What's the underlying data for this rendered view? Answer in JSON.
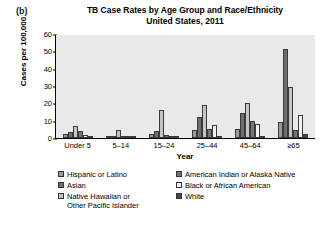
{
  "panel": {
    "label": "(b)"
  },
  "title": {
    "line1": "TB Case Rates by Age Group and Race/Ethnicity",
    "line2": "United States, 2011"
  },
  "axes": {
    "y_title": "Cases per 100,000",
    "x_title": "Year",
    "y_ticks": [
      "0",
      "10",
      "20",
      "30",
      "40",
      "50",
      "60"
    ]
  },
  "legend": {
    "left": [
      {
        "label": "Hispanic or Latino",
        "color": "#9a9a9a"
      },
      {
        "label": "Asian",
        "color": "#6e6e6e"
      },
      {
        "label": "Native Hawaiian or\nOther Pacific Islander",
        "color": "#c4c4c4"
      }
    ],
    "right": [
      {
        "label": "American Indian or Alaska Native",
        "color": "#757575"
      },
      {
        "label": "Black or African American",
        "color": "#f2f2f2"
      },
      {
        "label": "White",
        "color": "#4a4a4a"
      }
    ]
  },
  "chart_data": {
    "type": "bar",
    "title": "TB Case Rates by Age Group and Race/Ethnicity United States, 2011",
    "xlabel": "Year",
    "ylabel": "Cases per 100,000",
    "ylim": [
      0,
      60
    ],
    "ytick_step": 10,
    "grid": false,
    "legend_position": "below",
    "categories": [
      "Under 5",
      "5–14",
      "15–24",
      "25–44",
      "45–64",
      "≥65"
    ],
    "series": [
      {
        "name": "Hispanic or Latino",
        "color": "#9a9a9a",
        "values": [
          2.5,
          0.8,
          2.5,
          4.5,
          5.5,
          9.5
        ]
      },
      {
        "name": "Asian",
        "color": "#6e6e6e",
        "values": [
          3.5,
          1.0,
          4.0,
          12.0,
          14.5,
          52.0
        ]
      },
      {
        "name": "Native Hawaiian or Other Pacific Islander",
        "color": "#c4c4c4",
        "values": [
          7.0,
          4.5,
          16.5,
          19.5,
          20.5,
          30.0
        ]
      },
      {
        "name": "American Indian or Alaska Native",
        "color": "#757575",
        "values": [
          4.0,
          0.6,
          2.0,
          5.0,
          10.0,
          4.5
        ]
      },
      {
        "name": "Black or African American",
        "color": "#f2f2f2",
        "values": [
          1.8,
          0.5,
          1.0,
          7.5,
          8.0,
          13.5
        ]
      },
      {
        "name": "White",
        "color": "#4a4a4a",
        "values": [
          0.5,
          0.3,
          0.4,
          0.8,
          1.0,
          2.5
        ]
      }
    ]
  }
}
